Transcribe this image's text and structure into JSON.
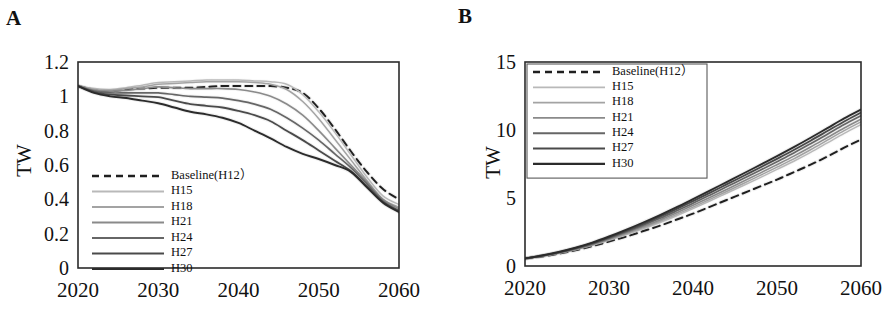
{
  "figure": {
    "panels": [
      {
        "id": "A",
        "label": "A",
        "ylabel": "TW",
        "legend_boxed": false
      },
      {
        "id": "B",
        "label": "B",
        "ylabel": "TW",
        "legend_boxed": true
      }
    ]
  },
  "chart_data": [
    {
      "panel": "A",
      "type": "line",
      "title": "",
      "xlabel": "",
      "ylabel": "TW",
      "xlim": [
        2020,
        2060
      ],
      "ylim": [
        0,
        1.2
      ],
      "xticks": [
        2020,
        2030,
        2040,
        2050,
        2060
      ],
      "yticks": [
        0,
        0.2,
        0.4,
        0.6,
        0.8,
        1,
        1.2
      ],
      "ytick_labels": [
        "0",
        "0.2",
        "0.4",
        "0.6",
        "0.8",
        "1",
        "1.2"
      ],
      "xtick_labels": [
        "2020",
        "2030",
        "2040",
        "2050",
        "2060"
      ],
      "grid": false,
      "legend_position": "lower-left-inside",
      "x": [
        2020,
        2022,
        2024,
        2026,
        2028,
        2030,
        2032,
        2034,
        2036,
        2038,
        2040,
        2042,
        2044,
        2046,
        2048,
        2050,
        2052,
        2054,
        2056,
        2058,
        2060
      ],
      "series": [
        {
          "name": "Baseline(H12）",
          "style": "dashed",
          "color": "#1f1f1f",
          "width": 2.0,
          "values": [
            1.06,
            1.04,
            1.03,
            1.04,
            1.045,
            1.05,
            1.05,
            1.05,
            1.055,
            1.06,
            1.06,
            1.06,
            1.06,
            1.05,
            1.02,
            0.93,
            0.81,
            0.68,
            0.56,
            0.46,
            0.4
          ]
        },
        {
          "name": "H15",
          "style": "solid",
          "color": "#b9b9b9",
          "width": 1.5,
          "values": [
            1.06,
            1.045,
            1.04,
            1.05,
            1.065,
            1.08,
            1.085,
            1.09,
            1.095,
            1.095,
            1.095,
            1.09,
            1.085,
            1.07,
            1.01,
            0.91,
            0.79,
            0.66,
            0.53,
            0.42,
            0.37
          ]
        },
        {
          "name": "H18",
          "style": "solid",
          "color": "#a3a3a3",
          "width": 1.5,
          "values": [
            1.06,
            1.04,
            1.035,
            1.045,
            1.055,
            1.07,
            1.075,
            1.08,
            1.085,
            1.085,
            1.085,
            1.08,
            1.07,
            1.04,
            0.97,
            0.87,
            0.75,
            0.63,
            0.51,
            0.4,
            0.355
          ]
        },
        {
          "name": "H21",
          "style": "solid",
          "color": "#8a8a8a",
          "width": 1.6,
          "values": [
            1.06,
            1.035,
            1.03,
            1.035,
            1.045,
            1.055,
            1.05,
            1.045,
            1.045,
            1.045,
            1.04,
            1.025,
            1.0,
            0.955,
            0.89,
            0.8,
            0.7,
            0.6,
            0.5,
            0.4,
            0.345
          ]
        },
        {
          "name": "H24",
          "style": "solid",
          "color": "#666666",
          "width": 1.7,
          "values": [
            1.06,
            1.03,
            1.02,
            1.02,
            1.02,
            1.02,
            1.01,
            1.0,
            0.995,
            0.99,
            0.975,
            0.955,
            0.925,
            0.875,
            0.815,
            0.745,
            0.665,
            0.585,
            0.49,
            0.39,
            0.335
          ]
        },
        {
          "name": "H27",
          "style": "solid",
          "color": "#4a4a4a",
          "width": 1.8,
          "values": [
            1.06,
            1.025,
            1.01,
            1.005,
            1.0,
            0.995,
            0.975,
            0.955,
            0.945,
            0.935,
            0.915,
            0.89,
            0.855,
            0.8,
            0.745,
            0.685,
            0.625,
            0.565,
            0.475,
            0.385,
            0.33
          ]
        },
        {
          "name": "H30",
          "style": "solid",
          "color": "#2b2b2b",
          "width": 1.9,
          "values": [
            1.06,
            1.02,
            1.0,
            0.99,
            0.975,
            0.96,
            0.935,
            0.91,
            0.895,
            0.875,
            0.845,
            0.8,
            0.755,
            0.705,
            0.665,
            0.635,
            0.6,
            0.56,
            0.47,
            0.38,
            0.325
          ]
        }
      ]
    },
    {
      "panel": "B",
      "type": "line",
      "title": "",
      "xlabel": "",
      "ylabel": "TW",
      "xlim": [
        2020,
        2060
      ],
      "ylim": [
        0,
        15
      ],
      "xticks": [
        2020,
        2030,
        2040,
        2050,
        2060
      ],
      "yticks": [
        0,
        5,
        10,
        15
      ],
      "ytick_labels": [
        "0",
        "5",
        "10",
        "15"
      ],
      "xtick_labels": [
        "2020",
        "2030",
        "2040",
        "2050",
        "2060"
      ],
      "grid": false,
      "legend_position": "upper-left-inside",
      "x": [
        2020,
        2022,
        2024,
        2026,
        2028,
        2030,
        2032,
        2034,
        2036,
        2038,
        2040,
        2042,
        2044,
        2046,
        2048,
        2050,
        2052,
        2054,
        2056,
        2058,
        2060
      ],
      "series": [
        {
          "name": "Baseline(H12）",
          "style": "dashed",
          "color": "#1f1f1f",
          "width": 2.0,
          "values": [
            0.55,
            0.7,
            0.9,
            1.15,
            1.45,
            1.8,
            2.15,
            2.55,
            2.95,
            3.4,
            3.85,
            4.35,
            4.85,
            5.35,
            5.85,
            6.35,
            6.9,
            7.45,
            8.05,
            8.7,
            9.3
          ]
        },
        {
          "name": "H15",
          "style": "solid",
          "color": "#b9b9b9",
          "width": 1.5,
          "values": [
            0.55,
            0.72,
            0.94,
            1.2,
            1.52,
            1.9,
            2.3,
            2.72,
            3.18,
            3.68,
            4.22,
            4.78,
            5.35,
            5.92,
            6.5,
            7.1,
            7.7,
            8.35,
            9.05,
            9.75,
            10.4
          ]
        },
        {
          "name": "H18",
          "style": "solid",
          "color": "#a3a3a3",
          "width": 1.5,
          "values": [
            0.55,
            0.73,
            0.95,
            1.22,
            1.55,
            1.94,
            2.35,
            2.8,
            3.27,
            3.78,
            4.33,
            4.9,
            5.48,
            6.07,
            6.66,
            7.27,
            7.88,
            8.55,
            9.25,
            9.95,
            10.6
          ]
        },
        {
          "name": "H21",
          "style": "solid",
          "color": "#8a8a8a",
          "width": 1.6,
          "values": [
            0.55,
            0.74,
            0.97,
            1.25,
            1.59,
            1.99,
            2.42,
            2.88,
            3.37,
            3.9,
            4.46,
            5.04,
            5.63,
            6.23,
            6.83,
            7.45,
            8.08,
            8.75,
            9.45,
            10.15,
            10.8
          ]
        },
        {
          "name": "H24",
          "style": "solid",
          "color": "#666666",
          "width": 1.7,
          "values": [
            0.55,
            0.75,
            0.99,
            1.28,
            1.63,
            2.05,
            2.5,
            2.98,
            3.49,
            4.04,
            4.61,
            5.21,
            5.82,
            6.43,
            7.04,
            7.67,
            8.31,
            8.99,
            9.69,
            10.4,
            11.05
          ]
        },
        {
          "name": "H27",
          "style": "solid",
          "color": "#4a4a4a",
          "width": 1.8,
          "values": [
            0.55,
            0.76,
            1.01,
            1.31,
            1.68,
            2.11,
            2.58,
            3.08,
            3.61,
            4.18,
            4.77,
            5.38,
            6.0,
            6.62,
            7.24,
            7.88,
            8.53,
            9.21,
            9.92,
            10.63,
            11.28
          ]
        },
        {
          "name": "H30",
          "style": "solid",
          "color": "#2b2b2b",
          "width": 1.9,
          "values": [
            0.55,
            0.77,
            1.03,
            1.34,
            1.72,
            2.17,
            2.66,
            3.18,
            3.73,
            4.31,
            4.92,
            5.54,
            6.17,
            6.8,
            7.44,
            8.08,
            8.74,
            9.43,
            10.14,
            10.85,
            11.5
          ]
        }
      ]
    }
  ]
}
